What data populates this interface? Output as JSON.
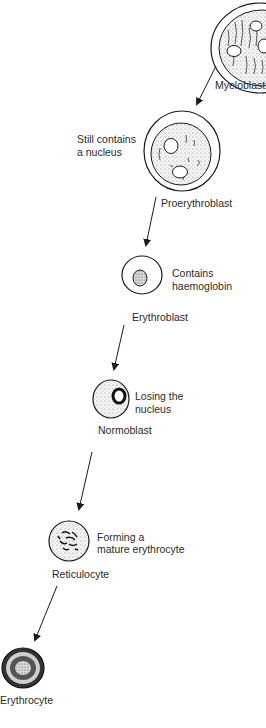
{
  "diagram": {
    "type": "cell-development-sequence",
    "stages": [
      {
        "name": "Myeloblast",
        "note": ""
      },
      {
        "name": "Proerythroblast",
        "note": "Still contains a nucleus",
        "note_lines": [
          "Still contains",
          "a nucleus"
        ]
      },
      {
        "name": "Erythroblast",
        "note": "Contains haemoglobin",
        "note_lines": [
          "Contains",
          "haemoglobin"
        ]
      },
      {
        "name": "Normoblast",
        "note": "Losing the nucleus",
        "note_lines": [
          "Losing the",
          "nucleus"
        ]
      },
      {
        "name": "Reticulocyte",
        "note": "Forming a mature erythrocyte",
        "note_lines": [
          "Forming a",
          "mature erythrocyte"
        ]
      },
      {
        "name": "Erythrocyte",
        "note": ""
      }
    ],
    "edges": [
      {
        "from": "Myeloblast",
        "to": "Proerythroblast"
      },
      {
        "from": "Proerythroblast",
        "to": "Erythroblast"
      },
      {
        "from": "Erythroblast",
        "to": "Normoblast"
      },
      {
        "from": "Normoblast",
        "to": "Reticulocyte"
      },
      {
        "from": "Reticulocyte",
        "to": "Erythrocyte"
      }
    ],
    "colors": {
      "line": "#1a1a1a",
      "fill": "#ffffff",
      "stipple": "#8a8a8a"
    }
  }
}
